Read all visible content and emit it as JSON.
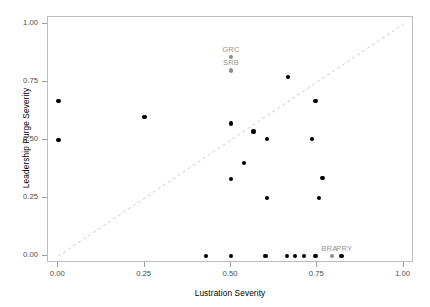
{
  "chart_data": {
    "type": "scatter",
    "title": "",
    "xlabel": "Lustration Severity",
    "ylabel": "Leadership Purge Severity",
    "xlim": [
      -0.03,
      1.03
    ],
    "ylim": [
      -0.03,
      1.03
    ],
    "xticks": [
      0.0,
      0.25,
      0.5,
      0.75,
      1.0
    ],
    "xticklabels": [
      "0.00",
      "0.25",
      "0.50",
      "0.75",
      "1.00"
    ],
    "yticks": [
      0.0,
      0.25,
      0.5,
      0.75,
      1.0
    ],
    "yticklabels": [
      "0.00",
      "0.25",
      "0.50",
      "0.75",
      "1.00"
    ],
    "grid": false,
    "legend": "none",
    "reference_line": {
      "type": "dashed-diagonal",
      "from": [
        0.0,
        0.0
      ],
      "to": [
        1.0,
        1.0
      ],
      "color": "#cccccc",
      "style": "dashed"
    },
    "point_color": "#000000",
    "highlight_color": "#8c8c8c",
    "label_color": "#949494",
    "points": [
      {
        "x": 0.0,
        "y": 0.667,
        "label": "",
        "highlight": false
      },
      {
        "x": 0.0,
        "y": 0.5,
        "label": "",
        "highlight": false
      },
      {
        "x": 0.25,
        "y": 0.6,
        "label": "",
        "highlight": false
      },
      {
        "x": 0.5,
        "y": 0.857,
        "label": "GRC",
        "highlight": true
      },
      {
        "x": 0.5,
        "y": 0.8,
        "label": "SRB",
        "highlight": true
      },
      {
        "x": 0.5,
        "y": 0.571,
        "label": "",
        "highlight": false
      },
      {
        "x": 0.5,
        "y": 0.333,
        "label": "",
        "highlight": false
      },
      {
        "x": 0.537,
        "y": 0.4,
        "label": "",
        "highlight": false
      },
      {
        "x": 0.565,
        "y": 0.536,
        "label": "",
        "highlight": false
      },
      {
        "x": 0.605,
        "y": 0.505,
        "label": "",
        "highlight": false
      },
      {
        "x": 0.605,
        "y": 0.25,
        "label": "",
        "highlight": false
      },
      {
        "x": 0.665,
        "y": 0.772,
        "label": "",
        "highlight": false
      },
      {
        "x": 0.745,
        "y": 0.667,
        "label": "",
        "highlight": false
      },
      {
        "x": 0.735,
        "y": 0.505,
        "label": "",
        "highlight": false
      },
      {
        "x": 0.765,
        "y": 0.337,
        "label": "",
        "highlight": false
      },
      {
        "x": 0.755,
        "y": 0.25,
        "label": "",
        "highlight": false
      },
      {
        "x": 0.428,
        "y": 0.0,
        "label": "",
        "highlight": false
      },
      {
        "x": 0.5,
        "y": 0.0,
        "label": "",
        "highlight": false
      },
      {
        "x": 0.6,
        "y": 0.0,
        "label": "",
        "highlight": false
      },
      {
        "x": 0.663,
        "y": 0.0,
        "label": "",
        "highlight": false
      },
      {
        "x": 0.686,
        "y": 0.0,
        "label": "",
        "highlight": false
      },
      {
        "x": 0.711,
        "y": 0.0,
        "label": "",
        "highlight": false
      },
      {
        "x": 0.745,
        "y": 0.0,
        "label": "",
        "highlight": false
      },
      {
        "x": 0.793,
        "y": 0.0,
        "label": "BRA",
        "highlight": true
      },
      {
        "x": 0.82,
        "y": 0.0,
        "label": "PRY",
        "highlight": false
      }
    ]
  }
}
